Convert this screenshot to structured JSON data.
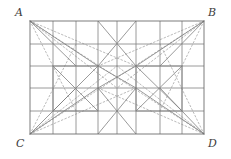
{
  "figure": {
    "kind": "geometry-diagram",
    "canvas": {
      "width": 231,
      "height": 159,
      "background": "#ffffff"
    },
    "colors": {
      "solid_stroke": "#808080",
      "dotted_stroke": "#a8a8a8",
      "outline_stroke": "#6e6e6e",
      "label_text": "#3d3d3d"
    },
    "stroke_widths": {
      "outline": 0.9,
      "solid": 0.8,
      "dotted": 0.8
    },
    "dash_pattern": "1.6 2.2",
    "rectangle": {
      "name": "ABCD",
      "left": 30,
      "top": 21,
      "right": 204,
      "bottom": 134,
      "width": 174,
      "height": 113
    },
    "vertices": [
      {
        "id": "A",
        "label": "A",
        "corner": "top-left",
        "x": 30,
        "y": 21
      },
      {
        "id": "B",
        "label": "B",
        "corner": "top-right",
        "x": 204,
        "y": 21
      },
      {
        "id": "C",
        "label": "C",
        "corner": "bottom-left",
        "x": 30,
        "y": 134
      },
      {
        "id": "D",
        "label": "D",
        "corner": "bottom-right",
        "x": 204,
        "y": 134
      }
    ],
    "grid": {
      "vertical_x": [
        30,
        53,
        76,
        98,
        117,
        136,
        160,
        182,
        204
      ],
      "horizontal_y": [
        21,
        44,
        66,
        88,
        111,
        134
      ]
    },
    "counts": {
      "vertical_lines": 9,
      "horizontal_lines": 6,
      "solid_diagonals": 16,
      "dotted_diagonals": 12
    }
  }
}
